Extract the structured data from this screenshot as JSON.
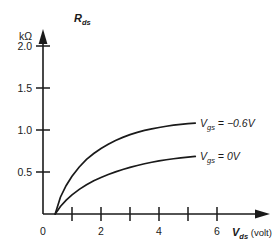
{
  "chart_data": {
    "type": "line",
    "title": "",
    "subtitle": "",
    "xlabel": "V",
    "xlabel_sub": "ds",
    "xlabel_unit": "(volt)",
    "ylabel": "R",
    "ylabel_sub": "ds",
    "ylabel_unit": "kΩ",
    "xlim": [
      0,
      6.8
    ],
    "ylim": [
      0,
      2.15
    ],
    "grid": false,
    "legend_position": "inline-right",
    "x_ticks": [
      1,
      2,
      3,
      4,
      5,
      6
    ],
    "x_tick_labels": [
      "",
      "2",
      "",
      "4",
      "",
      "6"
    ],
    "x_origin_label": "0",
    "y_ticks": [
      0.5,
      1.0,
      1.5,
      2.0
    ],
    "y_tick_labels": [
      "0.5",
      "1.0",
      "1.5",
      "2.0"
    ],
    "series": [
      {
        "name": "V",
        "name_sub": "gs",
        "name_value": "= −0.6V",
        "label_full": "Vgs = −0.6V",
        "color": "#1a1a1a",
        "x": [
          0.42,
          0.6,
          0.8,
          1.0,
          1.25,
          1.5,
          1.75,
          2.0,
          2.25,
          2.5,
          2.75,
          3.0,
          3.25,
          3.5,
          3.75,
          4.0,
          4.25,
          4.5,
          4.75,
          5.0,
          5.25
        ],
        "y": [
          0.0,
          0.2,
          0.34,
          0.45,
          0.56,
          0.65,
          0.72,
          0.78,
          0.83,
          0.875,
          0.912,
          0.945,
          0.972,
          0.995,
          1.014,
          1.03,
          1.045,
          1.057,
          1.067,
          1.075,
          1.082
        ]
      },
      {
        "name": "V",
        "name_sub": "gs",
        "name_value": "= 0V",
        "label_full": "Vgs = 0V",
        "color": "#1a1a1a",
        "x": [
          0.42,
          0.6,
          0.8,
          1.0,
          1.25,
          1.5,
          1.75,
          2.0,
          2.25,
          2.5,
          2.75,
          3.0,
          3.25,
          3.5,
          3.75,
          4.0,
          4.25,
          4.5,
          4.75,
          5.0,
          5.25
        ],
        "y": [
          0.0,
          0.09,
          0.165,
          0.228,
          0.293,
          0.348,
          0.395,
          0.435,
          0.47,
          0.502,
          0.53,
          0.555,
          0.578,
          0.598,
          0.616,
          0.632,
          0.646,
          0.658,
          0.668,
          0.677,
          0.685
        ]
      }
    ]
  },
  "geometry": {
    "origin_x": 43,
    "origin_y": 214,
    "x_per_unit": 29,
    "y_per_unit": 84
  }
}
